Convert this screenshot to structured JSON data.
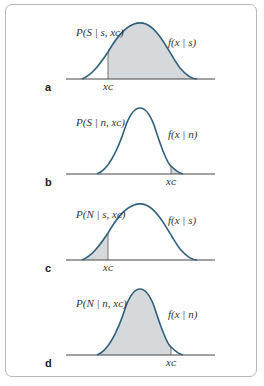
{
  "figure": {
    "panels": [
      {
        "letter": "a",
        "prob_label": "P(S | s, xᴄ)",
        "curve_label": "f(x | s)",
        "threshold_label": "xᴄ",
        "distribution": "signal",
        "shaded": "right"
      },
      {
        "letter": "b",
        "prob_label": "P(S | n, xᴄ)",
        "curve_label": "f(x | n)",
        "threshold_label": "xᴄ",
        "distribution": "noise",
        "shaded": "right"
      },
      {
        "letter": "c",
        "prob_label": "P(N | s, xᴄ)",
        "curve_label": "f(x | s)",
        "threshold_label": "xᴄ",
        "distribution": "signal",
        "shaded": "left"
      },
      {
        "letter": "d",
        "prob_label": "P(N | n, xᴄ)",
        "curve_label": "f(x | n)",
        "threshold_label": "xᴄ",
        "distribution": "noise",
        "shaded": "left"
      }
    ],
    "colors": {
      "curve": "#2f5f7a",
      "fill": "#d6d9db",
      "axis": "#444444",
      "frame": "#b8b8b8"
    }
  }
}
